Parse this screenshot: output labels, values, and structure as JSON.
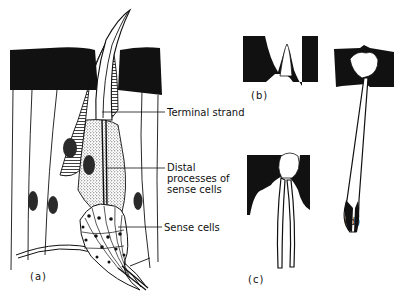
{
  "figure": {
    "panels": [
      {
        "id": "a",
        "label": "(a)"
      },
      {
        "id": "b",
        "label": "(b)"
      },
      {
        "id": "c",
        "label": "(c)"
      },
      {
        "id": "d",
        "label": "(d)"
      }
    ],
    "annotations": [
      {
        "id": "terminal-strand",
        "lines": [
          "Terminal strand"
        ]
      },
      {
        "id": "distal-processes",
        "lines": [
          "Distal",
          "processes of",
          "sense cells"
        ]
      },
      {
        "id": "sense-cells",
        "lines": [
          "Sense cells"
        ]
      }
    ]
  },
  "colors": {
    "ink": "#111111",
    "background": "#ffffff",
    "stipple": "#9a9a9a"
  }
}
